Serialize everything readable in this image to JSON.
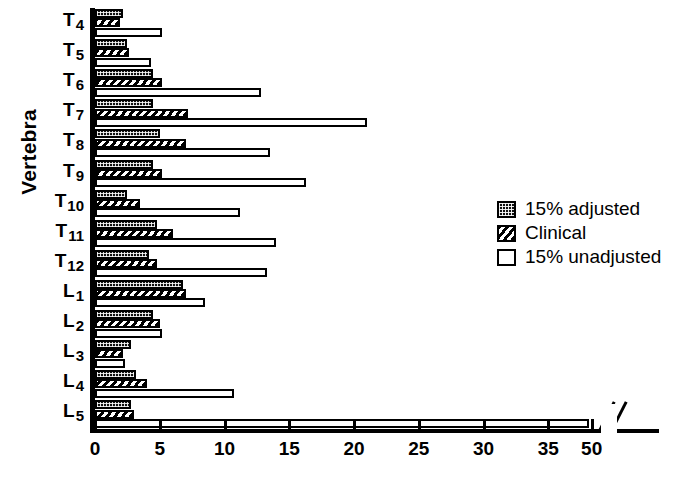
{
  "chart_data": {
    "type": "bar",
    "orientation": "horizontal",
    "title": "",
    "xlabel": "",
    "ylabel": "Vertebra",
    "xlim": [
      0,
      50
    ],
    "xticks": [
      0,
      5,
      10,
      15,
      20,
      25,
      30,
      35,
      50
    ],
    "xtick_labels": [
      "0",
      "5",
      "10",
      "15",
      "20",
      "25",
      "30",
      "35",
      "50"
    ],
    "axis_break": {
      "present": true,
      "after": 35,
      "before": 50,
      "symbol": "//"
    },
    "grid": false,
    "legend_position": "right-middle",
    "legend": [
      "15% adjusted",
      "Clinical",
      "15% unadjusted"
    ],
    "categories": [
      "T4",
      "T5",
      "T6",
      "T7",
      "T8",
      "T9",
      "T10",
      "T11",
      "T12",
      "L1",
      "L2",
      "L3",
      "L4",
      "L5"
    ],
    "series": [
      {
        "name": "15% adjusted",
        "fill": "checkered-dark",
        "values": [
          2.2,
          2.5,
          4.5,
          4.5,
          5.0,
          4.5,
          2.5,
          4.8,
          4.2,
          6.8,
          4.5,
          2.8,
          3.2,
          2.8
        ]
      },
      {
        "name": "Clinical",
        "fill": "diagonal-hatch",
        "values": [
          1.9,
          2.6,
          5.2,
          7.2,
          7.0,
          5.2,
          3.5,
          6.0,
          4.8,
          7.0,
          5.0,
          2.2,
          4.0,
          3.0
        ]
      },
      {
        "name": "15% unadjusted",
        "fill": "open-white",
        "values": [
          5.2,
          4.3,
          12.8,
          21.0,
          13.5,
          16.3,
          11.2,
          14.0,
          13.3,
          8.5,
          5.2,
          2.3,
          10.7,
          48.0
        ]
      }
    ]
  },
  "colors": {
    "ink": "#000000",
    "background": "#ffffff"
  }
}
